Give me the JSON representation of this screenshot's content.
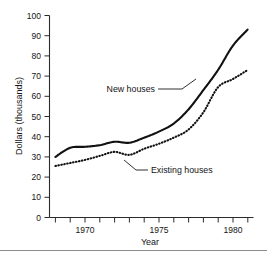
{
  "figure": {
    "background_color": "#ffffff",
    "foreground_color": "#1a1a1a",
    "bottom_rule_color": "#8d8d8d"
  },
  "axes": {
    "y_title": "Dollars (thousands)",
    "x_title": "Year",
    "y_ticks": [
      "0",
      "10",
      "20",
      "30",
      "40",
      "50",
      "60",
      "70",
      "80",
      "90",
      "100"
    ],
    "x_ticks_labeled": [
      "1970",
      "1975",
      "1980"
    ]
  },
  "annotations": {
    "new_houses_label": "New houses",
    "existing_houses_label": "Existing houses"
  },
  "chart_data": {
    "type": "line",
    "title": "",
    "xlabel": "Year",
    "ylabel": "Dollars (thousands)",
    "xlim": [
      1967.6,
      1981.4
    ],
    "ylim": [
      0,
      100
    ],
    "grid": false,
    "legend": "inline-annotations",
    "x": [
      1968,
      1969,
      1970,
      1971,
      1972,
      1973,
      1974,
      1975,
      1976,
      1977,
      1978,
      1979,
      1980,
      1981
    ],
    "series": [
      {
        "name": "New houses",
        "style": "solid",
        "color": "#111111",
        "values": [
          30.0,
          34.5,
          35.0,
          35.8,
          37.5,
          37.0,
          39.5,
          42.5,
          46.5,
          53.5,
          63.0,
          73.0,
          85.0,
          93.0
        ]
      },
      {
        "name": "Existing houses",
        "style": "dotted",
        "color": "#111111",
        "values": [
          25.5,
          27.0,
          28.5,
          30.5,
          32.5,
          31.0,
          34.0,
          36.5,
          39.5,
          43.5,
          52.0,
          64.5,
          68.5,
          73.0
        ]
      }
    ]
  }
}
